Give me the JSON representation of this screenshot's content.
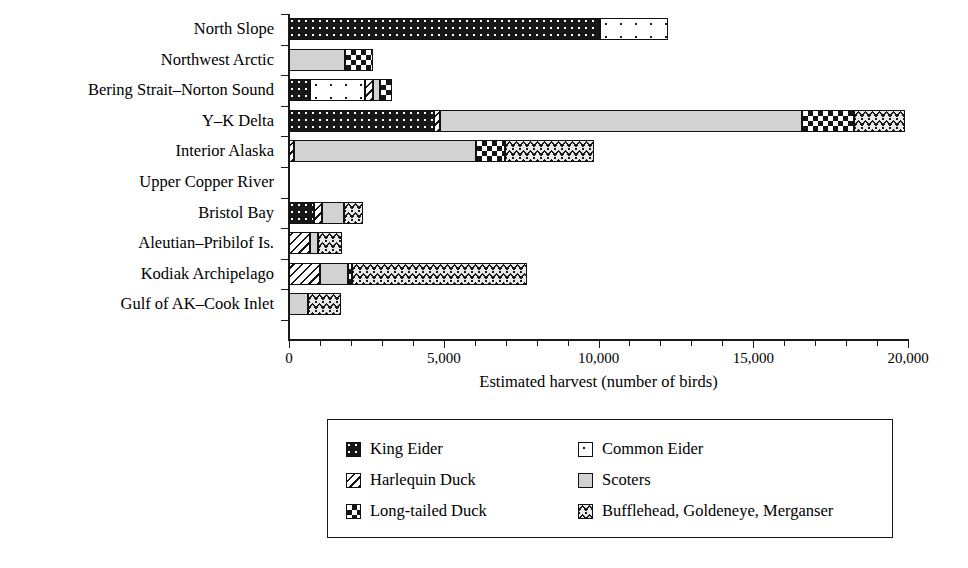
{
  "chart_data": {
    "type": "bar",
    "orientation": "horizontal",
    "stacked": true,
    "title": "",
    "xlabel": "Estimated harvest (number of birds)",
    "ylabel": "",
    "xlim": [
      0,
      20000
    ],
    "xticks": [
      0,
      5000,
      10000,
      15000,
      20000
    ],
    "xticklabels": [
      "0",
      "5,000",
      "10,000",
      "15,000",
      "20,000"
    ],
    "minor_tick_interval": 1000,
    "grid": false,
    "legend_position": "below-center",
    "categories": [
      "North Slope",
      "Northwest Arctic",
      "Bering Strait–Norton Sound",
      "Y–K Delta",
      "Interior Alaska",
      "Upper Copper River",
      "Bristol Bay",
      "Aleutian–Pribilof Is.",
      "Kodiak Archipelago",
      "Gulf of AK–Cook Inlet"
    ],
    "series": [
      {
        "name": "King Eider",
        "pattern": "pat-king",
        "values": [
          10050,
          0,
          680,
          4680,
          0,
          0,
          800,
          0,
          0,
          0
        ]
      },
      {
        "name": "Common Eider",
        "pattern": "pat-common",
        "values": [
          2200,
          0,
          1780,
          0,
          0,
          0,
          0,
          0,
          0,
          0
        ]
      },
      {
        "name": "Harlequin Duck",
        "pattern": "pat-harlequin",
        "values": [
          0,
          0,
          250,
          200,
          170,
          0,
          270,
          680,
          1000,
          0
        ]
      },
      {
        "name": "Scoters",
        "pattern": "pat-scoters",
        "values": [
          0,
          1800,
          240,
          11700,
          5870,
          0,
          700,
          270,
          900,
          620
        ]
      },
      {
        "name": "Long-tailed Duck",
        "pattern": "pat-longtailed",
        "values": [
          0,
          900,
          390,
          1680,
          930,
          0,
          0,
          0,
          130,
          0
        ]
      },
      {
        "name": "Bufflehead, Goldeneye, Merganser",
        "pattern": "pat-bufflehead",
        "values": [
          0,
          0,
          0,
          1640,
          2900,
          0,
          620,
          770,
          5650,
          1060
        ]
      }
    ],
    "totals": [
      12250,
      2700,
      3340,
      19900,
      9870,
      0,
      2390,
      1720,
      7680,
      1680
    ]
  },
  "legend": {
    "entries": [
      {
        "label": "King Eider",
        "pattern": "pat-king"
      },
      {
        "label": "Common Eider",
        "pattern": "pat-common"
      },
      {
        "label": "Harlequin Duck",
        "pattern": "pat-harlequin"
      },
      {
        "label": "Scoters",
        "pattern": "pat-scoters"
      },
      {
        "label": "Long-tailed Duck",
        "pattern": "pat-longtailed"
      },
      {
        "label": "Bufflehead, Goldeneye, Merganser",
        "pattern": "pat-bufflehead"
      }
    ],
    "order": [
      0,
      1,
      2,
      3,
      4,
      5
    ]
  },
  "colors": {
    "ink": "#1a1a1a",
    "background": "#ffffff",
    "scoters_fill": "#d2d2d2",
    "bufflehead_fill": "#e9e9e9",
    "king_fill": "#171717"
  }
}
